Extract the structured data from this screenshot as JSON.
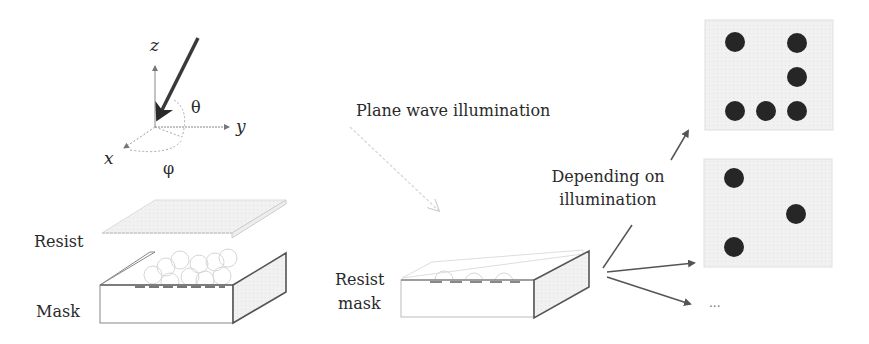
{
  "axes": {
    "z": "z",
    "y": "y",
    "x": "x",
    "theta": "θ",
    "phi": "φ"
  },
  "left_panel": {
    "resist_label": "Resist",
    "mask_label": "Mask"
  },
  "middle_panel": {
    "illumination_label": "Plane wave illumination",
    "resist_mask_label_line1": "Resist",
    "resist_mask_label_line2": "mask"
  },
  "right_panel": {
    "depending_line1": "Depending on",
    "depending_line2": "illumination",
    "ellipsis": "...",
    "pattern_1_dots": [
      [
        1,
        1
      ],
      [
        3,
        1
      ],
      [
        3,
        2
      ],
      [
        1,
        3
      ],
      [
        2,
        3
      ],
      [
        3,
        3
      ]
    ],
    "pattern_2_dots": [
      [
        1,
        1
      ],
      [
        3,
        2
      ],
      [
        1,
        3
      ]
    ]
  },
  "colors": {
    "line": "#555555",
    "dark_arrow": "#3a3a3a",
    "dot": "#262626",
    "panel_fill": "#eeeeee",
    "faint": "#c8c8c8"
  }
}
